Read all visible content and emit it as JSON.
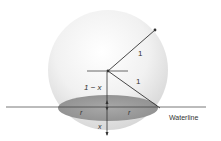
{
  "diagram": {
    "labels": {
      "radius_upper": "1",
      "radius_lower": "1",
      "depth_above": "1 − x",
      "r_left": "r",
      "r_right": "r",
      "depth_below": "x",
      "waterline": "Waterline"
    },
    "colors": {
      "background": "#ffffff",
      "sphere_light": "#f7f7f7",
      "sphere_shadow": "#d9d9d9",
      "water_section": "#9a9a9a",
      "lines": "#333333",
      "text": "#333333"
    }
  }
}
